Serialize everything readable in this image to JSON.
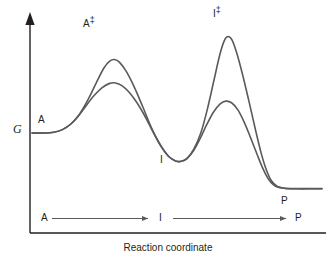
{
  "chart_data": {
    "type": "line",
    "title": "",
    "subtitle": "",
    "xlabel": "Reaction coordinate",
    "ylabel": "G",
    "xlim": [
      0,
      1
    ],
    "ylim": [
      0,
      1
    ],
    "grid": false,
    "legend": "none",
    "axis_style": "arrowed-y-axis-no-ticks",
    "annotations": [
      {
        "key": "reactant",
        "text": "A",
        "x": 0.1,
        "y": 0.44
      },
      {
        "key": "transition_state_1",
        "text": "A‡",
        "x": 0.255,
        "y": 0.9
      },
      {
        "key": "intermediate",
        "text": "I",
        "x": 0.45,
        "y": 0.29
      },
      {
        "key": "transition_state_2",
        "text": "I‡",
        "x": 0.645,
        "y": 0.955
      },
      {
        "key": "product",
        "text": "P",
        "x": 0.845,
        "y": 0.175
      }
    ],
    "series": [
      {
        "name": "uncatalyzed-higher-barrier",
        "color": "#595a5c",
        "linewidth": 1.6,
        "points": [
          [
            0.0,
            0.47
          ],
          [
            0.04,
            0.47
          ],
          [
            0.075,
            0.474
          ],
          [
            0.105,
            0.487
          ],
          [
            0.135,
            0.516
          ],
          [
            0.165,
            0.566
          ],
          [
            0.195,
            0.64
          ],
          [
            0.222,
            0.72
          ],
          [
            0.248,
            0.792
          ],
          [
            0.268,
            0.826
          ],
          [
            0.285,
            0.834
          ],
          [
            0.302,
            0.82
          ],
          [
            0.325,
            0.775
          ],
          [
            0.352,
            0.7
          ],
          [
            0.382,
            0.6
          ],
          [
            0.412,
            0.496
          ],
          [
            0.442,
            0.41
          ],
          [
            0.47,
            0.355
          ],
          [
            0.495,
            0.332
          ],
          [
            0.515,
            0.33
          ],
          [
            0.535,
            0.345
          ],
          [
            0.558,
            0.39
          ],
          [
            0.582,
            0.47
          ],
          [
            0.605,
            0.59
          ],
          [
            0.628,
            0.735
          ],
          [
            0.648,
            0.86
          ],
          [
            0.664,
            0.93
          ],
          [
            0.676,
            0.948
          ],
          [
            0.69,
            0.93
          ],
          [
            0.706,
            0.866
          ],
          [
            0.726,
            0.76
          ],
          [
            0.748,
            0.628
          ],
          [
            0.77,
            0.49
          ],
          [
            0.79,
            0.372
          ],
          [
            0.808,
            0.288
          ],
          [
            0.825,
            0.235
          ],
          [
            0.845,
            0.207
          ],
          [
            0.87,
            0.197
          ],
          [
            0.905,
            0.195
          ],
          [
            0.96,
            0.195
          ],
          [
            1.0,
            0.195
          ]
        ]
      },
      {
        "name": "catalyzed-lower-barrier",
        "color": "#595a5c",
        "linewidth": 1.6,
        "points": [
          [
            0.0,
            0.47
          ],
          [
            0.04,
            0.47
          ],
          [
            0.075,
            0.474
          ],
          [
            0.105,
            0.487
          ],
          [
            0.135,
            0.516
          ],
          [
            0.162,
            0.558
          ],
          [
            0.188,
            0.608
          ],
          [
            0.215,
            0.657
          ],
          [
            0.242,
            0.695
          ],
          [
            0.268,
            0.716
          ],
          [
            0.288,
            0.718
          ],
          [
            0.31,
            0.705
          ],
          [
            0.335,
            0.672
          ],
          [
            0.362,
            0.62
          ],
          [
            0.39,
            0.552
          ],
          [
            0.418,
            0.474
          ],
          [
            0.446,
            0.404
          ],
          [
            0.472,
            0.354
          ],
          [
            0.495,
            0.332
          ],
          [
            0.515,
            0.33
          ],
          [
            0.535,
            0.345
          ],
          [
            0.558,
            0.385
          ],
          [
            0.58,
            0.443
          ],
          [
            0.602,
            0.51
          ],
          [
            0.625,
            0.572
          ],
          [
            0.648,
            0.613
          ],
          [
            0.668,
            0.628
          ],
          [
            0.688,
            0.62
          ],
          [
            0.71,
            0.585
          ],
          [
            0.732,
            0.523
          ],
          [
            0.754,
            0.446
          ],
          [
            0.776,
            0.365
          ],
          [
            0.796,
            0.295
          ],
          [
            0.814,
            0.245
          ],
          [
            0.832,
            0.215
          ],
          [
            0.852,
            0.2
          ],
          [
            0.88,
            0.195
          ],
          [
            0.92,
            0.194
          ],
          [
            0.96,
            0.194
          ],
          [
            1.0,
            0.194
          ]
        ]
      }
    ]
  },
  "mechanism": {
    "step1_from": "A",
    "step1_to": "I",
    "step2_from": "I",
    "step2_to": "P",
    "arrow_color": "#595a5c"
  },
  "labels": {
    "reactant": "A",
    "ts1": "A",
    "ts1_dagger": "‡",
    "intermediate": "I",
    "ts2": "I",
    "ts2_dagger": "‡",
    "product": "P",
    "y_axis": "G",
    "x_axis": "Reaction coordinate"
  },
  "style": {
    "background": "#ffffff",
    "axis_color": "#231f20",
    "curve_color": "#595a5c",
    "text_color": "#231f20"
  }
}
